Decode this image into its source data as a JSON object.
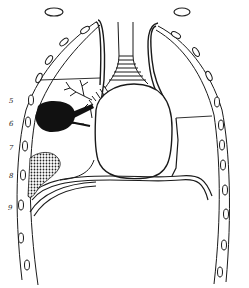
{
  "figure": {
    "rib_labels": [
      "5",
      "6",
      "7",
      "8",
      "9"
    ],
    "top_rib_markers": [
      "rib-section-left",
      "rib-section-right"
    ],
    "colors": {
      "ink": "#1a1a1a",
      "background": "#ffffff",
      "lesion": "#111111"
    }
  }
}
